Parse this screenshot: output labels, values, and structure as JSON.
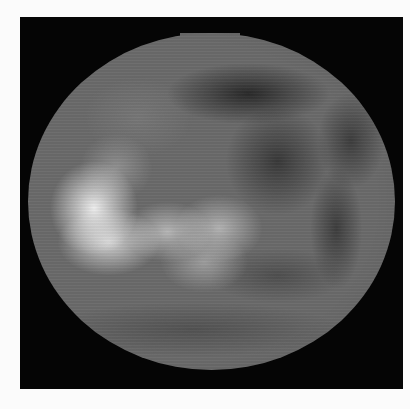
{
  "image": {
    "subject": "planetary-disk",
    "description": "Grayscale image of a planetary disk on black background with bright albedo region left-center and dark markings upper right",
    "colors": {
      "page_background": "#fbfbfb",
      "frame_background": "#050505",
      "disk_base": "#6a6a6a",
      "bright_region": "#f0f0f0",
      "dark_region": "#2a2a2a"
    }
  },
  "caption": {
    "text": ""
  }
}
